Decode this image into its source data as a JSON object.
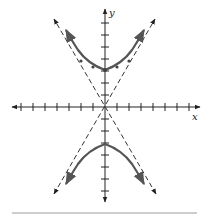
{
  "figure": {
    "type": "hyperbola-graph",
    "equation_form": "y^2/a^2 - x^2/b^2 = 1",
    "axes": {
      "x_label": "x",
      "y_label": "y",
      "tick_count_each_side": 7
    },
    "vertices": [
      [
        0,
        3
      ],
      [
        0,
        -3
      ]
    ],
    "asymptotes": [
      "y = 1.73x",
      "y = -1.73x"
    ],
    "marked_points": [
      [
        -2,
        3.7
      ],
      [
        -1,
        3.2
      ],
      [
        0,
        3
      ],
      [
        1,
        3.2
      ],
      [
        2,
        3.7
      ]
    ],
    "colors": {
      "axis": "#222222",
      "curve": "#555555",
      "asymptote": "#333333",
      "rule": "#9a9a9a"
    }
  }
}
